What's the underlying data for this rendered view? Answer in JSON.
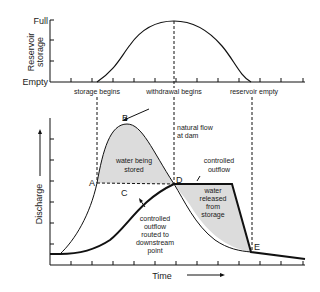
{
  "top_chart": {
    "ylabel_line1": "Reservoir",
    "ylabel_line2": "storage",
    "y_top_label": "Full",
    "y_bottom_label": "Empty",
    "event_labels": {
      "storage_begins": "storage begins",
      "withdrawal_begins": "withdrawal begins",
      "reservoir_empty": "reservoir empty"
    }
  },
  "bottom_chart": {
    "ylabel": "Discharge",
    "xlabel": "Time",
    "points": {
      "A": "A",
      "B": "B",
      "C": "C",
      "D": "D",
      "E": "E"
    },
    "annotations": {
      "natural_flow_1": "natural flow",
      "natural_flow_2": "at dam",
      "stored_1": "water being",
      "stored_2": "stored",
      "controlled_outflow_1": "controlled",
      "controlled_outflow_2": "outflow",
      "released_1": "water",
      "released_2": "released",
      "released_3": "from",
      "released_4": "storage",
      "routed_1": "controlled",
      "routed_2": "outflow",
      "routed_3": "routed to",
      "routed_4": "downstream",
      "routed_5": "point"
    }
  },
  "colors": {
    "line": "#111111",
    "shade": "#dcdcdc",
    "text": "#1a1a1a"
  }
}
